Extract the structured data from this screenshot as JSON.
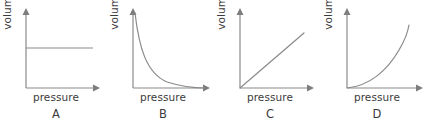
{
  "figure": {
    "background_color": "#ffffff",
    "axis_color": "#8a8a8a",
    "curve_color": "#8a8a8a",
    "text_color": "#3b3b3b"
  },
  "panels": [
    {
      "letter": "A",
      "x_label": "pressure",
      "y_label": "volume",
      "relationship": "constant",
      "curve_path": "M 26 48 L 93 48"
    },
    {
      "letter": "B",
      "x_label": "pressure",
      "y_label": "volume",
      "relationship": "inverse",
      "curve_path": "M 27 13 C 31 47, 38 73, 60 82 C 76 87, 88 88, 97 88"
    },
    {
      "letter": "C",
      "x_label": "pressure",
      "y_label": "volume",
      "relationship": "linear",
      "curve_path": "M 26 88 L 90 33"
    },
    {
      "letter": "D",
      "x_label": "pressure",
      "y_label": "volume",
      "relationship": "exponential",
      "curve_path": "M 26 88 C 47 86, 66 72, 78 52 C 84 43, 87 33, 88 26"
    }
  ],
  "chart_data": {
    "type": "line",
    "title": "",
    "xlabel": "pressure",
    "ylabel": "volume",
    "grid": false,
    "legend": "none",
    "xlim": [
      0,
      10
    ],
    "ylim": [
      0,
      10
    ],
    "panels": [
      {
        "label": "A",
        "title": "A",
        "xlabel": "pressure",
        "ylabel": "volume",
        "description": "volume constant as pressure increases",
        "x": [
          0.2,
          1,
          2,
          3,
          4,
          5,
          6,
          7
        ],
        "y": [
          6.2,
          6.2,
          6.2,
          6.2,
          6.2,
          6.2,
          6.2,
          6.2
        ]
      },
      {
        "label": "B",
        "title": "B",
        "xlabel": "pressure",
        "ylabel": "volume",
        "description": "volume decreases hyperbolically as pressure increases (inverse proportion)",
        "x": [
          0.2,
          0.5,
          1,
          1.5,
          2,
          3,
          4,
          5,
          6,
          7,
          8
        ],
        "y": [
          9.6,
          6.0,
          3.4,
          2.4,
          1.8,
          1.2,
          0.9,
          0.6,
          0.4,
          0.25,
          0.1
        ]
      },
      {
        "label": "C",
        "title": "C",
        "xlabel": "pressure",
        "ylabel": "volume",
        "description": "volume increases linearly with pressure",
        "x": [
          0,
          1,
          2,
          3,
          4,
          5,
          6,
          7
        ],
        "y": [
          0,
          1.1,
          2.2,
          3.3,
          4.4,
          5.5,
          6.6,
          7.7
        ]
      },
      {
        "label": "D",
        "title": "D",
        "xlabel": "pressure",
        "ylabel": "volume",
        "description": "volume increases exponentially with pressure",
        "x": [
          0,
          1,
          2,
          3,
          4,
          5,
          6,
          6.5
        ],
        "y": [
          0,
          0.3,
          0.8,
          1.7,
          3.2,
          5.4,
          7.8,
          9.0
        ]
      }
    ]
  }
}
